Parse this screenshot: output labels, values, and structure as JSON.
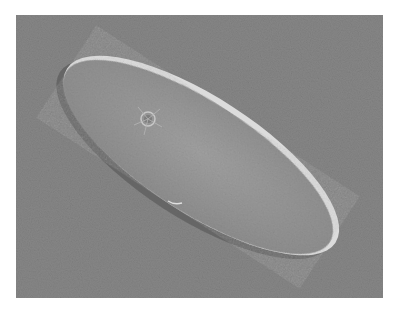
{
  "image": {
    "subject": "Paramecium (ciliate protozoan) under DIC microscopy",
    "alt": "Micrograph of a paramecium cell on a gray background",
    "colors": {
      "page_background": "#ffffff",
      "photo_background": "#8a8a8a",
      "cell_body": "#9a9a9a",
      "cell_rim_highlight": "#e6e6e6",
      "cell_shadow": "#5a5a5a"
    }
  }
}
